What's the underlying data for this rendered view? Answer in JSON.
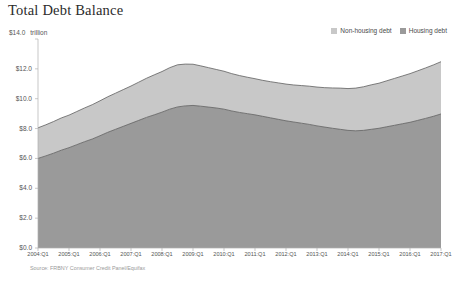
{
  "chart_title": "Total Debt Balance",
  "unit_prefix": "$14.0",
  "unit_word": "trillion",
  "source_note": "Source: FRBNY Consumer Credit Panel/Equifax",
  "legend": {
    "position": "top-right",
    "entries": [
      {
        "label": "Non-housing debt",
        "color": "#c8c8c8",
        "name": "non-housing-debt"
      },
      {
        "label": "Housing debt",
        "color": "#9a9a9a",
        "name": "housing-debt"
      }
    ]
  },
  "colors": {
    "non_housing": "#c8c8c8",
    "housing": "#9a9a9a",
    "line": "#5f5f5f",
    "axis": "#b0b0b0",
    "text": "#555555",
    "title": "#2b2b2b"
  },
  "chart_data": {
    "type": "area",
    "stacked": true,
    "title": "Total Debt Balance",
    "xlabel": "",
    "ylabel": "trillion",
    "ylim": [
      0,
      14
    ],
    "ytick_labels": [
      "$14.0",
      "$12.0",
      "$10.0",
      "$8.0",
      "$6.0",
      "$4.0",
      "$2.0",
      "$0.0"
    ],
    "ytick_values": [
      14,
      12,
      10,
      8,
      6,
      4,
      2,
      0
    ],
    "grid": false,
    "legend_position": "top-right",
    "xtick_labels": [
      "2004:Q1",
      "2005:Q1",
      "2006:Q1",
      "2007:Q1",
      "2008:Q1",
      "2009:Q1",
      "2010:Q1",
      "2011:Q1",
      "2012:Q1",
      "2013:Q1",
      "2014:Q1",
      "2015:Q1",
      "2016:Q1",
      "2017:Q1"
    ],
    "x": [
      "2004:Q1",
      "2004:Q2",
      "2004:Q3",
      "2004:Q4",
      "2005:Q1",
      "2005:Q2",
      "2005:Q3",
      "2005:Q4",
      "2006:Q1",
      "2006:Q2",
      "2006:Q3",
      "2006:Q4",
      "2007:Q1",
      "2007:Q2",
      "2007:Q3",
      "2007:Q4",
      "2008:Q1",
      "2008:Q2",
      "2008:Q3",
      "2008:Q4",
      "2009:Q1",
      "2009:Q2",
      "2009:Q3",
      "2009:Q4",
      "2010:Q1",
      "2010:Q2",
      "2010:Q3",
      "2010:Q4",
      "2011:Q1",
      "2011:Q2",
      "2011:Q3",
      "2011:Q4",
      "2012:Q1",
      "2012:Q2",
      "2012:Q3",
      "2012:Q4",
      "2013:Q1",
      "2013:Q2",
      "2013:Q3",
      "2013:Q4",
      "2014:Q1",
      "2014:Q2",
      "2014:Q3",
      "2014:Q4",
      "2015:Q1",
      "2015:Q2",
      "2015:Q3",
      "2015:Q4",
      "2016:Q1",
      "2016:Q2",
      "2016:Q3",
      "2016:Q4",
      "2017:Q1"
    ],
    "series": [
      {
        "name": "Housing debt",
        "color": "#9a9a9a",
        "values": [
          6.0,
          6.17,
          6.35,
          6.55,
          6.72,
          6.92,
          7.12,
          7.3,
          7.52,
          7.75,
          7.95,
          8.15,
          8.35,
          8.55,
          8.75,
          8.92,
          9.1,
          9.3,
          9.45,
          9.52,
          9.55,
          9.5,
          9.44,
          9.38,
          9.3,
          9.18,
          9.08,
          9.0,
          8.92,
          8.82,
          8.72,
          8.62,
          8.52,
          8.44,
          8.36,
          8.28,
          8.18,
          8.1,
          8.02,
          7.95,
          7.88,
          7.85,
          7.88,
          7.95,
          8.02,
          8.12,
          8.22,
          8.32,
          8.42,
          8.55,
          8.68,
          8.82,
          8.98
        ]
      },
      {
        "name": "Non-housing debt",
        "color": "#c8c8c8",
        "values": [
          2.05,
          2.08,
          2.12,
          2.16,
          2.18,
          2.22,
          2.26,
          2.3,
          2.34,
          2.38,
          2.42,
          2.46,
          2.5,
          2.56,
          2.62,
          2.68,
          2.72,
          2.78,
          2.82,
          2.8,
          2.76,
          2.7,
          2.64,
          2.58,
          2.54,
          2.5,
          2.47,
          2.44,
          2.42,
          2.41,
          2.42,
          2.44,
          2.46,
          2.48,
          2.52,
          2.56,
          2.6,
          2.64,
          2.7,
          2.76,
          2.8,
          2.86,
          2.92,
          2.98,
          3.02,
          3.08,
          3.14,
          3.2,
          3.26,
          3.32,
          3.38,
          3.44,
          3.5
        ]
      }
    ],
    "totals": [
      8.05,
      8.25,
      8.47,
      8.71,
      8.9,
      9.14,
      9.38,
      9.6,
      9.86,
      10.13,
      10.37,
      10.61,
      10.85,
      11.11,
      11.37,
      11.6,
      11.82,
      12.08,
      12.27,
      12.32,
      12.31,
      12.2,
      12.08,
      11.96,
      11.84,
      11.68,
      11.55,
      11.44,
      11.34,
      11.23,
      11.14,
      11.06,
      10.98,
      10.92,
      10.88,
      10.84,
      10.78,
      10.74,
      10.72,
      10.71,
      10.68,
      10.71,
      10.8,
      10.93,
      11.04,
      11.2,
      11.36,
      11.52,
      11.68,
      11.87,
      12.06,
      12.26,
      12.48
    ]
  }
}
